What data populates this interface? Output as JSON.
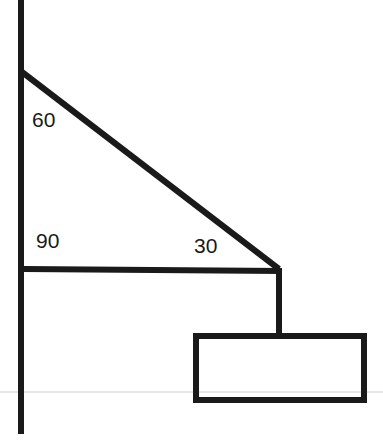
{
  "diagram": {
    "type": "free-body / angle diagram",
    "angles": {
      "top_wall_angle": "60",
      "bottom_wall_angle": "90",
      "right_angle": "30"
    },
    "colors": {
      "stroke": "#1a1a1a",
      "background": "#ffffff",
      "scan_line": "#e4e4e4"
    }
  }
}
